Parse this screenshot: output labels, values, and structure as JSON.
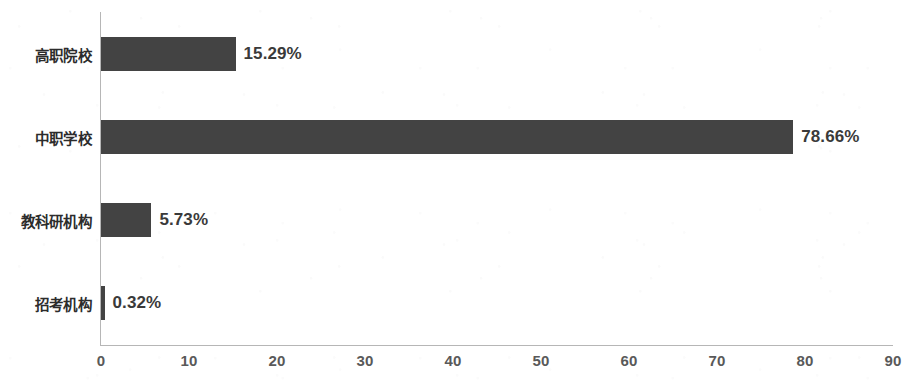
{
  "chart_data": {
    "type": "bar",
    "orientation": "horizontal",
    "title": "",
    "subtitle": "",
    "xlabel": "",
    "ylabel": "",
    "categories": [
      "高职院校",
      "中职学校",
      "教科研机构",
      "招考机构"
    ],
    "values": [
      15.29,
      78.66,
      5.73,
      0.32
    ],
    "value_labels": [
      "15.29%",
      "78.66%",
      "5.73%",
      "0.32%"
    ],
    "series": [
      {
        "name": "",
        "values": [
          15.29,
          78.66,
          5.73,
          0.32
        ]
      }
    ],
    "xlim": [
      0,
      90
    ],
    "xticks": [
      0,
      10,
      20,
      30,
      40,
      50,
      60,
      70,
      80,
      90
    ],
    "xtick_labels": [
      "0",
      "10",
      "20",
      "30",
      "40",
      "50",
      "60",
      "70",
      "80",
      "90"
    ],
    "grid": false,
    "legend": false,
    "legend_position": "none",
    "bar_color": "#434343",
    "axis_color": "#b6b6b6",
    "text_color": "#2c2c2c",
    "background": "#ffffff"
  }
}
